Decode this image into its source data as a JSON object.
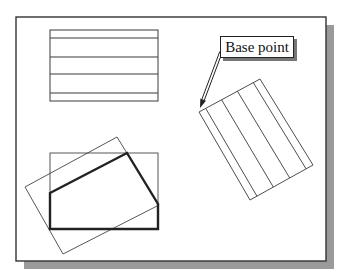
{
  "figure": {
    "callout": {
      "label": "Base point"
    },
    "colors": {
      "line": "#3a3a3a",
      "thick_line": "#222222",
      "shadow": "#9a9a9a",
      "background": "#ffffff"
    },
    "frame": {
      "x": 16,
      "y": 17,
      "width": 310,
      "height": 244,
      "shadow_offset": 8
    },
    "striped_rectangle_original": {
      "x": 50,
      "y": 30,
      "width": 108,
      "height": 71,
      "stripe_y": [
        38,
        57,
        74,
        93
      ]
    },
    "striped_rectangle_rotated": {
      "corners": [
        [
          199,
          112
        ],
        [
          260,
          79
        ],
        [
          313,
          165
        ],
        [
          250,
          200
        ]
      ],
      "stripe_fractions": [
        0.11,
        0.37,
        0.63,
        0.89
      ]
    },
    "arrow": {
      "from": [
        221,
        52
      ],
      "to": [
        200,
        108
      ]
    },
    "polygon_group": {
      "bounding_rectangle": {
        "x": 50,
        "y": 153,
        "width": 108,
        "height": 76
      },
      "thick_polygon": [
        [
          50,
          193
        ],
        [
          127,
          153
        ],
        [
          158,
          204
        ],
        [
          158,
          229
        ],
        [
          50,
          229
        ]
      ],
      "rotated_rectangle": [
        [
          25,
          187
        ],
        [
          117,
          137
        ],
        [
          159,
          205
        ],
        [
          63,
          254
        ]
      ]
    }
  }
}
